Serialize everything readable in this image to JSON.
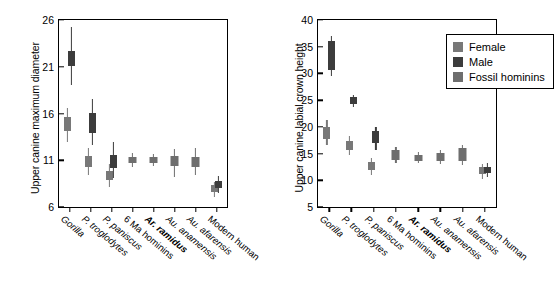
{
  "figure": {
    "legend": {
      "entries": [
        {
          "label": "Female",
          "color": "#787878"
        },
        {
          "label": "Male",
          "color": "#3c3c3c"
        },
        {
          "label": "Fossil hominins",
          "color": "#6e6e6e"
        }
      ]
    }
  },
  "chart_data": [
    {
      "type": "box",
      "panel": "left",
      "title": "",
      "xlabel": "",
      "ylabel": "Upper canine maximum diameter",
      "ylim": [
        6,
        26
      ],
      "yticks": [
        6,
        11,
        16,
        21,
        26
      ],
      "grid": false,
      "legend_position": "none",
      "categories": [
        "Gorilla",
        "P. troglodytes",
        "P. paniscus",
        "6 Ma hominins",
        "Ar. ramidus",
        "Au. anamensis",
        "Au. afarensis",
        "Modern human"
      ],
      "category_styles": [
        "italic",
        "italic",
        "italic",
        "upright",
        "bold-italic",
        "italic",
        "italic",
        "upright"
      ],
      "boxes": [
        {
          "category": "Gorilla",
          "series": "Female",
          "whisker_low": 12.9,
          "q1": 14.1,
          "q3": 15.6,
          "whisker_high": 16.6
        },
        {
          "category": "Gorilla",
          "series": "Male",
          "whisker_low": 19.1,
          "q1": 21.1,
          "q3": 22.7,
          "whisker_high": 25.3
        },
        {
          "category": "P. troglodytes",
          "series": "Female",
          "whisker_low": 9.4,
          "q1": 10.3,
          "q3": 11.5,
          "whisker_high": 12.3
        },
        {
          "category": "P. troglodytes",
          "series": "Male",
          "whisker_low": 12.6,
          "q1": 13.9,
          "q3": 16.1,
          "whisker_high": 17.6
        },
        {
          "category": "P. paniscus",
          "series": "Female",
          "whisker_low": 8.1,
          "q1": 8.9,
          "q3": 9.8,
          "whisker_high": 10.6
        },
        {
          "category": "P. paniscus",
          "series": "Male",
          "whisker_low": 9.1,
          "q1": 10.2,
          "q3": 11.6,
          "whisker_high": 13.0
        },
        {
          "category": "6 Ma hominins",
          "series": "Fossil hominins",
          "whisker_low": 10.3,
          "q1": 10.7,
          "q3": 11.4,
          "whisker_high": 11.8
        },
        {
          "category": "Ar. ramidus",
          "series": "Fossil hominins",
          "whisker_low": 10.4,
          "q1": 10.7,
          "q3": 11.4,
          "whisker_high": 11.7
        },
        {
          "category": "Au. anamensis",
          "series": "Fossil hominins",
          "whisker_low": 9.2,
          "q1": 10.4,
          "q3": 11.5,
          "whisker_high": 12.2
        },
        {
          "category": "Au. afarensis",
          "series": "Fossil hominins",
          "whisker_low": 9.4,
          "q1": 10.3,
          "q3": 11.3,
          "whisker_high": 12.3
        },
        {
          "category": "Modern human",
          "series": "Female",
          "whisker_low": 7.1,
          "q1": 7.6,
          "q3": 8.3,
          "whisker_high": 8.7
        },
        {
          "category": "Modern human",
          "series": "Male",
          "whisker_low": 7.5,
          "q1": 8.0,
          "q3": 8.8,
          "whisker_high": 9.3
        }
      ]
    },
    {
      "type": "box",
      "panel": "right",
      "title": "",
      "xlabel": "",
      "ylabel": "Upper canine labial crown height",
      "ylim": [
        5,
        40
      ],
      "yticks": [
        5,
        10,
        15,
        20,
        25,
        30,
        35,
        40
      ],
      "grid": false,
      "legend_position": "top-right",
      "categories": [
        "Gorilla",
        "P. troglodytes",
        "P. paniscus",
        "6 Ma hominins",
        "Ar. ramidus",
        "Au. anamensis",
        "Au. afarensis",
        "Modern human"
      ],
      "category_styles": [
        "italic",
        "italic",
        "italic",
        "upright",
        "bold-italic",
        "italic",
        "italic",
        "upright"
      ],
      "boxes": [
        {
          "category": "Gorilla",
          "series": "Female",
          "whisker_low": 16.6,
          "q1": 17.7,
          "q3": 20.0,
          "whisker_high": 21.3
        },
        {
          "category": "Gorilla",
          "series": "Male",
          "whisker_low": 29.6,
          "q1": 30.6,
          "q3": 36.0,
          "whisker_high": 37.0
        },
        {
          "category": "P. troglodytes",
          "series": "Female",
          "whisker_low": 14.8,
          "q1": 15.7,
          "q3": 17.4,
          "whisker_high": 18.3
        },
        {
          "category": "P. troglodytes",
          "series": "Male",
          "whisker_low": 23.8,
          "q1": 24.2,
          "q3": 25.5,
          "whisker_high": 26.0
        },
        {
          "category": "P. paniscus",
          "series": "Female",
          "whisker_low": 11.0,
          "q1": 12.0,
          "q3": 13.4,
          "whisker_high": 14.2
        },
        {
          "category": "P. paniscus",
          "series": "Male",
          "whisker_low": 15.7,
          "q1": 17.0,
          "q3": 19.3,
          "whisker_high": 20.0
        },
        {
          "category": "6 Ma hominins",
          "series": "Fossil hominins",
          "whisker_low": 13.2,
          "q1": 13.8,
          "q3": 15.6,
          "whisker_high": 16.2
        },
        {
          "category": "Ar. ramidus",
          "series": "Fossil hominins",
          "whisker_low": 13.2,
          "q1": 13.6,
          "q3": 14.8,
          "whisker_high": 15.3
        },
        {
          "category": "Au. anamensis",
          "series": "Fossil hominins",
          "whisker_low": 13.1,
          "q1": 13.7,
          "q3": 15.1,
          "whisker_high": 15.6
        },
        {
          "category": "Au. afarensis",
          "series": "Fossil hominins",
          "whisker_low": 12.8,
          "q1": 13.7,
          "q3": 16.0,
          "whisker_high": 16.6
        },
        {
          "category": "Modern human",
          "series": "Female",
          "whisker_low": 10.2,
          "q1": 11.1,
          "q3": 12.4,
          "whisker_high": 13.1
        },
        {
          "category": "Modern human",
          "series": "Male",
          "whisker_low": 10.6,
          "q1": 11.3,
          "q3": 12.4,
          "whisker_high": 13.2
        }
      ]
    }
  ]
}
